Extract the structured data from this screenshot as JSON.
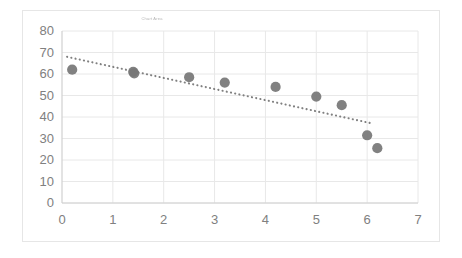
{
  "chart_data": {
    "type": "scatter",
    "title": "Chart Area",
    "xlabel": "",
    "ylabel": "",
    "xlim": [
      0,
      7
    ],
    "ylim": [
      0,
      80
    ],
    "x_ticks": [
      0,
      1,
      2,
      3,
      4,
      5,
      6,
      7
    ],
    "y_ticks": [
      0,
      10,
      20,
      30,
      40,
      50,
      60,
      70,
      80
    ],
    "grid": true,
    "legend": "none",
    "marker_color": "#767676",
    "trendline_color": "#808080",
    "gridline_color": "#e8e8e8",
    "axis_label_color": "#808080",
    "points": [
      {
        "x": 0.2,
        "y": 62
      },
      {
        "x": 1.4,
        "y": 61
      },
      {
        "x": 1.42,
        "y": 60.3
      },
      {
        "x": 2.5,
        "y": 58.5
      },
      {
        "x": 3.2,
        "y": 56
      },
      {
        "x": 4.2,
        "y": 54
      },
      {
        "x": 5.0,
        "y": 49.5
      },
      {
        "x": 5.5,
        "y": 45.5
      },
      {
        "x": 6.0,
        "y": 31.5
      },
      {
        "x": 6.2,
        "y": 25.5
      }
    ],
    "trendline": {
      "style": "dotted",
      "x_start": 0.1,
      "y_start": 68,
      "x_end": 6.1,
      "y_end": 37
    }
  }
}
